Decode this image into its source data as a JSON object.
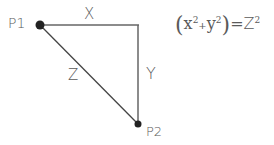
{
  "diagram": {
    "type": "right-triangle",
    "points": [
      {
        "id": "p1",
        "label": "P1",
        "x": 40,
        "y": 25
      },
      {
        "id": "p2",
        "label": "P2",
        "x": 138,
        "y": 124
      }
    ],
    "corner": {
      "x": 138,
      "y": 25
    },
    "edges": [
      {
        "id": "x",
        "label": "X",
        "from": "p1",
        "to": "corner"
      },
      {
        "id": "y",
        "label": "Y",
        "from": "corner",
        "to": "p2"
      },
      {
        "id": "z",
        "label": "Z",
        "from": "p1",
        "to": "p2"
      }
    ],
    "equation": {
      "text": "(x²+y²)=Z²",
      "lhs_a": "x",
      "lhs_b": "y",
      "rhs": "Z",
      "exp": "2",
      "plus": "+",
      "equals": "="
    },
    "colors": {
      "line": "#555555",
      "dot": "#222222",
      "text": "#5a5a5a"
    }
  }
}
